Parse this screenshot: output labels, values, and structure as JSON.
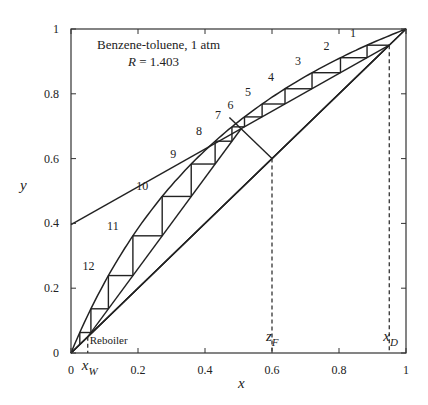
{
  "chart_data": {
    "type": "line",
    "title": "Benzene-toluene, 1 atm",
    "subtitle": "R = 1.403",
    "annotation_lines": [
      "Benzene-toluene, 1 atm",
      "R = 1.403"
    ],
    "xlabel": "x",
    "ylabel": "y",
    "xlim": [
      0,
      1
    ],
    "ylim": [
      0,
      1
    ],
    "x_ticks": [
      0,
      0.2,
      0.4,
      0.6,
      0.8,
      1
    ],
    "x_tick_labels": [
      "0",
      "0.2",
      "0.4",
      "0.6",
      "0.8",
      "1"
    ],
    "y_ticks": [
      0,
      0.2,
      0.4,
      0.6,
      0.8,
      1
    ],
    "y_tick_labels": [
      "0",
      "0.2",
      "0.4",
      "0.6",
      "0.8",
      "1"
    ],
    "grid": false,
    "relative_volatility": 2.5,
    "x_D": 0.95,
    "z_F": 0.6,
    "x_W": 0.05,
    "q": 0.5,
    "reflux_ratio": 1.403,
    "rectifying_intercept": 0.396,
    "marker_labels": {
      "x_W": "x",
      "x_W_sub": "W",
      "z_F": "z",
      "z_F_sub": "F",
      "x_D": "x",
      "x_D_sub": "D"
    },
    "stage_labels": [
      "1",
      "2",
      "3",
      "4",
      "5",
      "6",
      "7",
      "8",
      "9",
      "10",
      "11",
      "12"
    ],
    "reboiler_label": "Reboiler",
    "series": [
      {
        "name": "Equilibrium curve",
        "kind": "equilibrium"
      },
      {
        "name": "45° line",
        "x": [
          0,
          1
        ],
        "y": [
          0,
          1
        ]
      },
      {
        "name": "Rectifying operating line",
        "x": [
          0,
          0.95
        ],
        "y": [
          0.396,
          0.95
        ]
      },
      {
        "name": "Stripping operating line",
        "x": [
          0.05,
          0.48
        ],
        "y": [
          0.05,
          0.68
        ]
      },
      {
        "name": "q-line",
        "x": [
          0.6,
          0.48
        ],
        "y": [
          0.6,
          0.72
        ]
      }
    ]
  }
}
